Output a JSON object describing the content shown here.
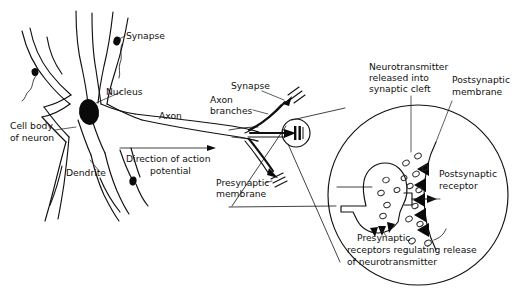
{
  "figure": {
    "background_color": "#ffffff",
    "line_color": "#111111",
    "width": 519,
    "height": 293
  },
  "labels": {
    "synapse_top": "Synapse",
    "nucleus": "Nucleus",
    "cell_body_line1": "Cell body",
    "cell_body_line2": "of neuron",
    "dendrite": "Dendrite",
    "axon": "Axon",
    "direction_line1": "Direction of action",
    "direction_line2": "potential",
    "synapse_mid": "Synapse",
    "axon_branches_line1": "Axon",
    "axon_branches_line2": "branches",
    "presynaptic_membrane_line1": "Presynaptic",
    "presynaptic_membrane_line2": "membrane",
    "neurotransmitter_line1": "Neurotransmitter",
    "neurotransmitter_line2": "released into",
    "neurotransmitter_line3": "synaptic cleft",
    "postsynaptic_membrane_line1": "Postsynaptic",
    "postsynaptic_membrane_line2": "membrane",
    "postsynaptic_receptor_line1": "Postsynaptic",
    "postsynaptic_receptor_line2": "receptor",
    "presynaptic_receptors_line1": "Presynaptic",
    "presynaptic_receptors_line2": "receptors regulating release",
    "presynaptic_receptors_line3": "of neurotransmitter"
  },
  "structures": {
    "neuron_soma": "cell-body",
    "nucleus_shape": "filled-ellipse",
    "dendrite_count": 5,
    "axon_branch_count": 3,
    "synapse_bouton_count": 4,
    "magnified_circle": "synaptic-cleft-detail",
    "vesicle_count": 17,
    "postsynaptic_receptor_count": 6,
    "presynaptic_receptor_count": 3
  }
}
